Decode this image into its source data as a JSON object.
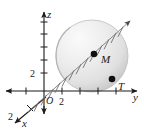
{
  "figure": {
    "type": "math-diagram-3d-coordinate-sphere",
    "background_color": "#ffffff",
    "axes": [
      {
        "id": "x",
        "label": "x",
        "label_x": 30,
        "label_y": 124,
        "direction": "down-left",
        "tick_labels": [
          "2"
        ]
      },
      {
        "id": "y",
        "label": "y",
        "label_x": 135,
        "label_y": 98,
        "direction": "right",
        "tick_labels": [
          "2"
        ]
      },
      {
        "id": "z",
        "label": "z",
        "label_x": 45,
        "label_y": 14,
        "direction": "up",
        "tick_labels": [
          "2"
        ]
      }
    ],
    "origin": {
      "label": "O",
      "x": 44,
      "y": 99
    },
    "tick_label_x": {
      "text": "2",
      "x": 8,
      "y": 118
    },
    "tick_label_y": {
      "text": "2",
      "x": 62,
      "y": 110
    },
    "tick_label_z": {
      "text": "2",
      "x": 26,
      "y": 68
    },
    "axis_label_x": {
      "text": "x",
      "x": 22,
      "y": 124
    },
    "axis_label_y": {
      "text": "y",
      "x": 134,
      "y": 99
    },
    "axis_label_z": {
      "text": "z",
      "x": 44,
      "y": 15
    },
    "sphere": {
      "center_x": 92,
      "center_y": 56,
      "radius": 36,
      "fill_light": "#f3f3f3",
      "fill_mid": "#e2e2e2",
      "fill_dark": "#c9c9c9",
      "stroke": "#b8b8b8"
    },
    "points": [
      {
        "name": "M",
        "label": "M",
        "x": 94,
        "y": 54,
        "label_x": 101,
        "label_y": 62,
        "radius": 3.2,
        "color": "#111111"
      },
      {
        "name": "T",
        "label": "T",
        "x": 112,
        "y": 79,
        "label_x": 118,
        "label_y": 90,
        "radius": 3.2,
        "color": "#111111"
      }
    ],
    "ray": {
      "name": "hatched-diagonal-ray",
      "x1": 28,
      "y1": 112,
      "x2": 132,
      "y2": 20,
      "style": "hatched-arrow",
      "color": "#6a6a6a"
    },
    "colors": {
      "axis": "#1a1a1a",
      "point": "#111111",
      "sphere_edge": "#b8b8b8"
    }
  }
}
